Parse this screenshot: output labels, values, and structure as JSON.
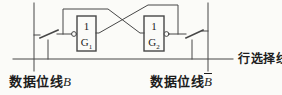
{
  "figure": {
    "kind": "sram-memory-cell-circuit",
    "colors": {
      "background": "#fbfbf8",
      "line": "#474747",
      "text": "#1c1c1c"
    },
    "gates": {
      "g1": {
        "function_symbol": "1",
        "label": "G",
        "subscript": "1"
      },
      "g2": {
        "function_symbol": "1",
        "label": "G",
        "subscript": "2"
      }
    },
    "labels": {
      "left_bit_line": {
        "prefix": "数据位线",
        "signal": "B",
        "overline": false
      },
      "right_bit_line": {
        "prefix": "数据位线",
        "signal": "B",
        "overline": true
      },
      "row_select": {
        "text": "行选择线"
      }
    }
  }
}
